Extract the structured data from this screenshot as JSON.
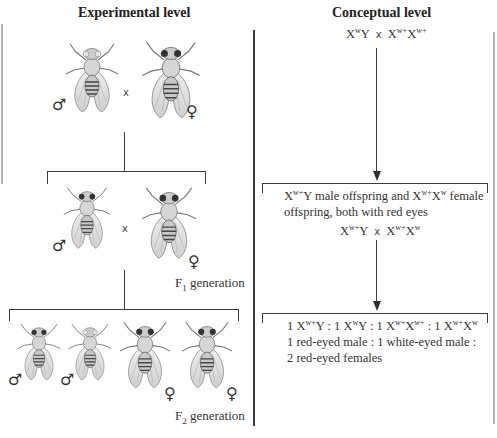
{
  "headings": {
    "experimental": "Experimental level",
    "conceptual": "Conceptual level"
  },
  "experimental": {
    "parental_cross": {
      "male": {
        "sex_symbol": "♂",
        "eye": "white"
      },
      "cross": "x",
      "female": {
        "sex_symbol": "♀",
        "eye": "red"
      }
    },
    "f1": {
      "male": {
        "sex_symbol": "♂",
        "eye": "red"
      },
      "cross": "x",
      "female": {
        "sex_symbol": "♀",
        "eye": "red"
      },
      "label_prefix": "F",
      "label_sub": "1",
      "label_suffix": " generation"
    },
    "f2": {
      "flies": [
        {
          "sex_symbol": "♂",
          "eye": "red"
        },
        {
          "sex_symbol": "♂",
          "eye": "white"
        },
        {
          "sex_symbol": "♀",
          "eye": "red"
        },
        {
          "sex_symbol": "♀",
          "eye": "red"
        }
      ],
      "label_prefix": "F",
      "label_sub": "2",
      "label_suffix": " generation"
    }
  },
  "conceptual": {
    "parental": {
      "male": {
        "base": "X",
        "sup": "w",
        "rest": "Y"
      },
      "cross": "x",
      "female": {
        "base1": "X",
        "sup1": "w+",
        "base2": "X",
        "sup2": "w+"
      }
    },
    "f1_box": {
      "line1_a_base": "X",
      "line1_a_sup": "w+",
      "line1_a_rest": "Y male offspring and ",
      "line1_b_base": "X",
      "line1_b_sup": "w+",
      "line1_b_base2": "X",
      "line1_b_sup2": "w",
      "line1_b_rest": " female",
      "line2": "offspring, both with red eyes",
      "cross": {
        "male": {
          "base": "X",
          "sup": "w+",
          "rest": "Y"
        },
        "x": "x",
        "female": {
          "base1": "X",
          "sup1": "w+",
          "base2": "X",
          "sup2": "w"
        }
      }
    },
    "f2_box": {
      "ratio": [
        {
          "count": "1",
          "base": "X",
          "sup": "w+",
          "rest": "Y"
        },
        {
          "count": "1",
          "base": "X",
          "sup": "w",
          "rest": "Y"
        },
        {
          "count": "1",
          "base": "X",
          "sup": "w+",
          "base2": "X",
          "sup2": "w+"
        },
        {
          "count": "1",
          "base": "X",
          "sup": "w+",
          "base2": "X",
          "sup2": "w"
        }
      ],
      "separator": " : ",
      "phenotype_line1": "1 red-eyed male : 1 white-eyed male :",
      "phenotype_line2": "2 red-eyed females"
    }
  },
  "colors": {
    "line": "#3a3a3a",
    "frame_gray": "#b5b5b5",
    "text": "#333333"
  }
}
